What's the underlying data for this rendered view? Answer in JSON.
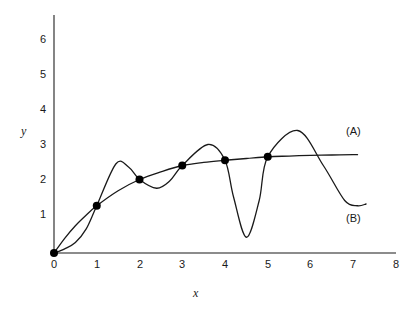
{
  "chart_data": {
    "type": "line",
    "title": "",
    "subtitle": "",
    "xlabel": "x",
    "ylabel": "y",
    "xlim": [
      0,
      8
    ],
    "ylim": [
      0,
      6.5
    ],
    "xticks": [
      "0",
      "1",
      "2",
      "3",
      "4",
      "5",
      "6",
      "7",
      "8"
    ],
    "xtick_values": [
      0,
      1,
      2,
      3,
      4,
      5,
      6,
      7,
      8
    ],
    "yticks": [
      "1",
      "2",
      "3",
      "4",
      "5",
      "6"
    ],
    "ytick_values": [
      1,
      2,
      3,
      4,
      5,
      6
    ],
    "grid": false,
    "legend_position": "inline-right",
    "axis_color": "#555555",
    "curve_color": "#1a1a1a",
    "marker_color": "#000000",
    "background": "#ffffff",
    "data_points": {
      "name": "data points",
      "marker": "filled-circle",
      "x": [
        0,
        1,
        2,
        3,
        4,
        5
      ],
      "y": [
        0.0,
        1.35,
        2.1,
        2.5,
        2.65,
        2.75
      ]
    },
    "series": [
      {
        "name": "(A)",
        "label": "(A)",
        "description": "smooth monotonic fitted curve",
        "x": [
          0,
          0.25,
          0.5,
          0.75,
          1,
          1.5,
          2,
          2.5,
          3,
          3.5,
          4,
          4.5,
          5,
          5.5,
          6,
          6.5,
          7,
          7.1
        ],
        "y": [
          0.0,
          0.42,
          0.78,
          1.08,
          1.35,
          1.78,
          2.1,
          2.32,
          2.5,
          2.59,
          2.65,
          2.7,
          2.75,
          2.77,
          2.79,
          2.8,
          2.81,
          2.81
        ]
      },
      {
        "name": "(B)",
        "label": "(B)",
        "description": "oscillating interpolating polynomial",
        "x": [
          0,
          0.25,
          0.5,
          0.75,
          1,
          1.45,
          1.75,
          2,
          2.4,
          2.7,
          3,
          3.6,
          4,
          4.2,
          4.5,
          4.8,
          5,
          5.7,
          6.3,
          6.8,
          7.1,
          7.3
        ],
        "y": [
          0.0,
          0.12,
          0.3,
          0.68,
          1.35,
          2.55,
          2.45,
          2.1,
          1.85,
          2.05,
          2.5,
          3.1,
          2.65,
          1.6,
          0.45,
          1.5,
          2.75,
          3.5,
          2.5,
          1.5,
          1.35,
          1.4
        ]
      }
    ],
    "annotations": [
      {
        "text": "(A)",
        "x": 7.4,
        "y": 3.15
      },
      {
        "text": "(B)",
        "x": 7.4,
        "y": 1.2
      }
    ]
  },
  "axes": {
    "y_title": "y",
    "x_title": "x",
    "x_tick_labels": [
      "0",
      "1",
      "2",
      "3",
      "4",
      "5",
      "6",
      "7",
      "8"
    ],
    "y_tick_labels": [
      "6",
      "5",
      "4",
      "3",
      "2",
      "1"
    ]
  },
  "labels": {
    "curve_a": "(A)",
    "curve_b": "(B)"
  }
}
